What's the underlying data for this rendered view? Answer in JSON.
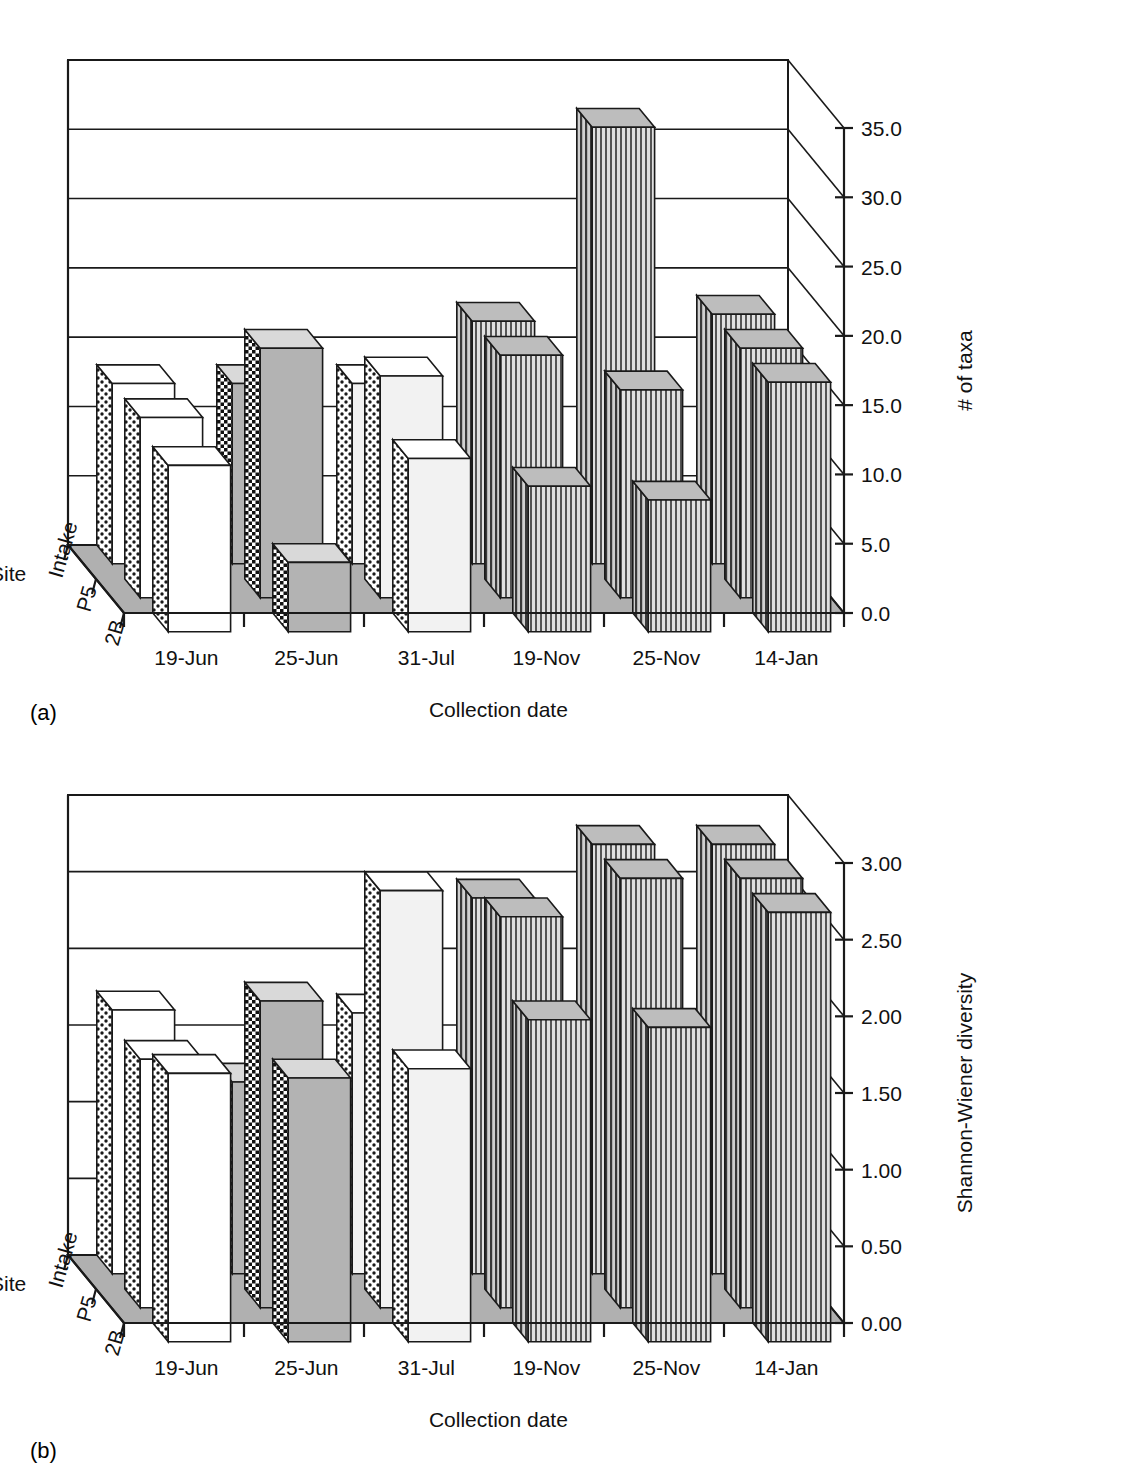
{
  "figure": {
    "panel_a_tag": "(a)",
    "panel_b_tag": "(b)",
    "sites_axis_label": "Site",
    "date_axis_label": "Collection date"
  },
  "chart_data": [
    {
      "type": "bar",
      "id": "panel-a",
      "title": "",
      "xlabel": "Collection date",
      "ylabel": "# of taxa",
      "zlabel": "Site",
      "ylim": [
        0,
        35
      ],
      "ytick_labels": [
        "0.0",
        "5.0",
        "10.0",
        "15.0",
        "20.0",
        "25.0",
        "30.0",
        "35.0"
      ],
      "ytick_values": [
        0,
        5,
        10,
        15,
        20,
        25,
        30,
        35
      ],
      "grid": true,
      "legend_position": "none",
      "categories": [
        "19-Jun",
        "25-Jun",
        "31-Jul",
        "19-Nov",
        "25-Nov",
        "14-Jan"
      ],
      "sites": [
        "Intake",
        "P5",
        "2B"
      ],
      "series": [
        {
          "name": "Intake",
          "values": [
            13.0,
            13.0,
            13.0,
            17.5,
            31.5,
            18.0
          ]
        },
        {
          "name": "P5",
          "values": [
            13.0,
            18.0,
            16.0,
            17.5,
            15.0,
            18.0
          ]
        },
        {
          "name": "2B",
          "values": [
            12.0,
            5.0,
            12.5,
            10.5,
            9.5,
            18.0
          ]
        }
      ]
    },
    {
      "type": "bar",
      "id": "panel-b",
      "title": "",
      "xlabel": "Collection date",
      "ylabel": "Shannon-Wiener diversity",
      "zlabel": "Site",
      "ylim": [
        0,
        3.0
      ],
      "ytick_labels": [
        "0.00",
        "0.50",
        "1.00",
        "1.50",
        "2.00",
        "2.50",
        "3.00"
      ],
      "ytick_values": [
        0,
        0.5,
        1.0,
        1.5,
        2.0,
        2.5,
        3.0
      ],
      "grid": true,
      "legend_position": "none",
      "categories": [
        "19-Jun",
        "25-Jun",
        "31-Jul",
        "19-Nov",
        "25-Nov",
        "14-Jan"
      ],
      "sites": [
        "Intake",
        "P5",
        "2B"
      ],
      "series": [
        {
          "name": "Intake",
          "values": [
            1.72,
            1.25,
            1.7,
            2.45,
            2.8,
            2.8
          ]
        },
        {
          "name": "P5",
          "values": [
            1.62,
            2.0,
            2.72,
            2.55,
            2.8,
            2.8
          ]
        },
        {
          "name": "2B",
          "values": [
            1.75,
            1.72,
            1.78,
            2.1,
            2.05,
            2.8
          ]
        }
      ]
    }
  ],
  "patterns": {
    "groups": [
      {
        "date": "19-Jun",
        "side": "dots-light",
        "front": "#ffffff",
        "top": "#ffffff"
      },
      {
        "date": "25-Jun",
        "side": "checker-dark",
        "front": "#b3b3b3",
        "top": "#d9d9d9"
      },
      {
        "date": "31-Jul",
        "side": "dots-light",
        "front": "#f2f2f2",
        "top": "#ffffff"
      },
      {
        "date": "19-Nov",
        "side": "vlines",
        "front": "#8c8c8c",
        "top": "#bdbdbd"
      },
      {
        "date": "25-Nov",
        "side": "vlines",
        "front": "#8c8c8c",
        "top": "#bdbdbd"
      },
      {
        "date": "14-Jan",
        "side": "vlines",
        "front": "#8c8c8c",
        "top": "#bdbdbd"
      }
    ],
    "floor_color": "#b0b0b0",
    "wall_color": "#ffffff",
    "line_color": "#1a1a1a"
  }
}
